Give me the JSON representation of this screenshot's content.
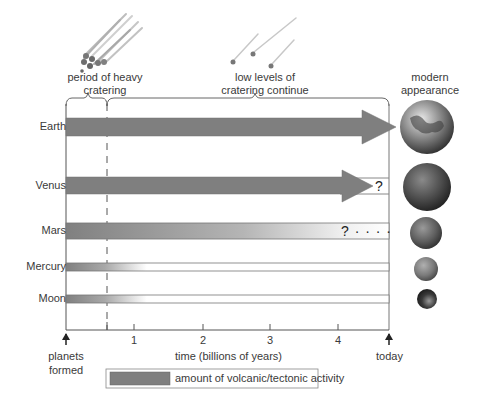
{
  "header": {
    "heavy_cratering_label": "period of heavy cratering",
    "heavy_cratering_line1": "period of heavy",
    "heavy_cratering_line2": "cratering",
    "low_cratering_line1": "low levels of",
    "low_cratering_line2": "cratering continue",
    "modern_line1": "modern",
    "modern_line2": "appearance"
  },
  "rows": [
    {
      "name": "Earth",
      "shape": "arrow",
      "fade": false,
      "end_mark": "",
      "color": "#7f7f7f"
    },
    {
      "name": "Venus",
      "shape": "arrow",
      "fade": false,
      "end_mark": "?",
      "color": "#7f7f7f"
    },
    {
      "name": "Mars",
      "shape": "bar-fade",
      "fade": true,
      "end_mark": "? · · · ·",
      "color": "#7f7f7f"
    },
    {
      "name": "Mercury",
      "shape": "thin-fade",
      "fade": true,
      "end_mark": "",
      "color": "#7f7f7f"
    },
    {
      "name": "Moon",
      "shape": "thin-fade",
      "fade": true,
      "end_mark": "",
      "color": "#7f7f7f"
    }
  ],
  "axis": {
    "title": "time (billions of years)",
    "ticks": [
      "1",
      "2",
      "3",
      "4"
    ],
    "start_line1": "planets",
    "start_line2": "formed",
    "end_label": "today"
  },
  "legend": {
    "label": "amount of volcanic/tectonic activity",
    "swatch_color": "#7f7f7f"
  },
  "planet_images": [
    "earth-globe",
    "venus-globe",
    "mars-globe",
    "mercury-globe",
    "moon-globe"
  ]
}
